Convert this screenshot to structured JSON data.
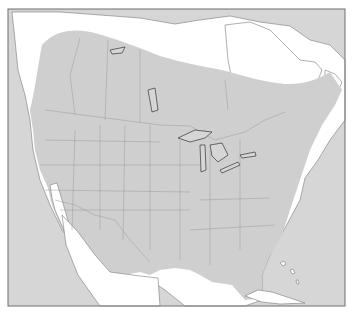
{
  "map": {
    "title": "Species range map of North America",
    "subject": "Distribution range (shaded) across North America",
    "legend": [],
    "colors": {
      "ocean": "#d6d6d6",
      "land_outside_range": "#ffffff",
      "range_fill": "#cfcfcf",
      "borders": "#9a9a9a",
      "frame": "#6f6f6f"
    },
    "regions_in_range": [
      "Southern Canada",
      "Contiguous United States",
      "Northern Mexico (east)",
      "Great Lakes region"
    ],
    "regions_outside_range": [
      "Arctic Canada",
      "Northern Quebec / Labrador",
      "Baja California & Gulf of California coast",
      "Southern Mexico",
      "Cuba"
    ]
  }
}
